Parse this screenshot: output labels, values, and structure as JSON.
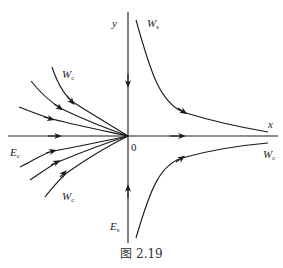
{
  "diagram": {
    "type": "phase-portrait",
    "colors": {
      "stroke": "#1a1a1a",
      "background": "#ffffff"
    },
    "axes": {
      "x_label": "x",
      "y_label": "y",
      "origin_label": "0"
    },
    "labels": {
      "ws_top": {
        "main": "W",
        "sub": "s"
      },
      "wc_upper_left": {
        "main": "W",
        "sub": "c"
      },
      "wc_lower_left": {
        "main": "W",
        "sub": "c"
      },
      "wc_right": {
        "main": "W",
        "sub": "c"
      },
      "ec_left": {
        "main": "E",
        "sub": "c"
      },
      "es_bottom": {
        "main": "E",
        "sub": "s"
      }
    },
    "caption": "图 2.19"
  }
}
